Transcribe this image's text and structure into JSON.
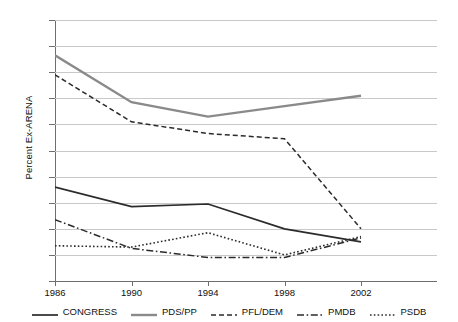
{
  "chart_data": {
    "type": "line",
    "title": "",
    "xlabel": "",
    "ylabel": "Percent Ex-ARENA",
    "categories": [
      "1986",
      "1990",
      "1994",
      "1998",
      "2002"
    ],
    "x": [
      1986,
      1990,
      1994,
      1998,
      2002
    ],
    "ylim": [
      0,
      100
    ],
    "yticks": [
      0,
      10,
      20,
      30,
      40,
      50,
      60,
      70,
      80,
      90,
      100
    ],
    "grid": true,
    "legend_position": "bottom",
    "series": [
      {
        "name": "CONGRESS",
        "values": [
          36,
          28.5,
          29.5,
          20,
          15
        ],
        "color": "#2b2b2b",
        "style": "solid",
        "width": 1.7
      },
      {
        "name": "PDS/PP",
        "values": [
          86.5,
          68.5,
          63,
          67,
          71
        ],
        "color": "#8a8a8a",
        "style": "solid",
        "width": 2.4
      },
      {
        "name": "PFL/DEM",
        "values": [
          79,
          61,
          56.5,
          54.5,
          20
        ],
        "color": "#2b2b2b",
        "style": "dashed",
        "width": 1.5
      },
      {
        "name": "PMDB",
        "values": [
          23.5,
          12.5,
          9,
          9,
          16.5
        ],
        "color": "#2b2b2b",
        "style": "dashdot",
        "width": 1.5
      },
      {
        "name": "PSDB",
        "values": [
          13.5,
          13,
          18.5,
          10,
          17
        ],
        "color": "#2b2b2b",
        "style": "dotted",
        "width": 1.6
      }
    ]
  },
  "axis": {
    "y_title": "Percent Ex-ARENA",
    "y_tick_labels": [
      "100",
      "90",
      "80",
      "70",
      "60",
      "50",
      "40",
      "30",
      "20",
      "10",
      "0"
    ],
    "x_tick_labels": [
      "1986",
      "1990",
      "1994",
      "1998",
      "2002"
    ]
  },
  "legend": {
    "items": [
      {
        "label": "CONGRESS"
      },
      {
        "label": "PDS/PP"
      },
      {
        "label": "PFL/DEM"
      },
      {
        "label": "PMDB"
      },
      {
        "label": "PSDB"
      }
    ]
  }
}
